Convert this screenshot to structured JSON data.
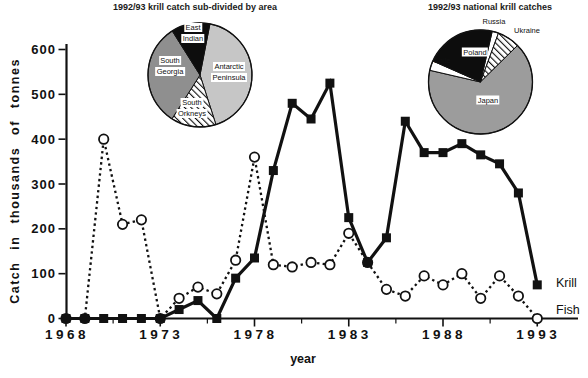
{
  "figure": {
    "background": "#ffffff",
    "ink": "#111111",
    "gray_light": "#c6c6c6",
    "gray_mid": "#9c9c9c",
    "gray_dark": "#8f8f8f",
    "black": "#0d0d0d"
  },
  "pies": [
    {
      "title": "1992/93 krill catch sub-divided by area",
      "start_angle_deg": 11,
      "slices": [
        {
          "label": "Antarctic Peninsula",
          "percent": 42,
          "fill": "#c6c6c6",
          "pattern": "solid"
        },
        {
          "label": "South Orkneys",
          "percent": 14,
          "fill": "#ffffff",
          "pattern": "hatch"
        },
        {
          "label": "South Georgia",
          "percent": 32,
          "fill": "#8f8f8f",
          "pattern": "solid"
        },
        {
          "label": "East Indian",
          "percent": 12,
          "fill": "#0d0d0d",
          "pattern": "solid"
        }
      ]
    },
    {
      "title": "1992/93 national krill catches",
      "start_angle_deg": 13,
      "slices": [
        {
          "label": "Russia",
          "percent": 2,
          "fill": "#ffffff",
          "pattern": "solid"
        },
        {
          "label": "Ukraine",
          "percent": 7,
          "fill": "#ffffff",
          "pattern": "hatch"
        },
        {
          "label": "Japan",
          "percent": 66,
          "fill": "#9c9c9c",
          "pattern": "solid"
        },
        {
          "label": "Chile",
          "percent": 3,
          "fill": "#ffffff",
          "pattern": "solid"
        },
        {
          "label": "Poland",
          "percent": 22,
          "fill": "#0d0d0d",
          "pattern": "solid"
        }
      ]
    }
  ],
  "chart_data": {
    "type": "line",
    "title": "",
    "xlabel": "year",
    "ylabel": "Catch in thousands of tonnes",
    "x": [
      1968,
      1969,
      1970,
      1971,
      1972,
      1973,
      1974,
      1975,
      1976,
      1977,
      1978,
      1979,
      1980,
      1981,
      1982,
      1983,
      1984,
      1985,
      1986,
      1987,
      1988,
      1989,
      1990,
      1991,
      1992,
      1993
    ],
    "x_tick_labels": [
      1968,
      1973,
      1978,
      1983,
      1988,
      1993
    ],
    "x_minor_ticks": [
      1970.5,
      1975.5,
      1980.5,
      1985.5,
      1990.5
    ],
    "ylim": [
      0,
      600
    ],
    "y_ticks": [
      0,
      100,
      200,
      300,
      400,
      500,
      600
    ],
    "grid": false,
    "legend_position": "line-end-right",
    "series": [
      {
        "name": "Krill",
        "line_style": "solid",
        "marker": "filled-square",
        "values": [
          0,
          0,
          0,
          0,
          0,
          0,
          20,
          40,
          0,
          90,
          135,
          330,
          480,
          445,
          525,
          225,
          125,
          180,
          440,
          370,
          370,
          390,
          365,
          345,
          280,
          75
        ]
      },
      {
        "name": "Fish",
        "line_style": "dotted",
        "marker": "open-circle",
        "values": [
          0,
          0,
          400,
          210,
          220,
          0,
          45,
          70,
          55,
          130,
          360,
          120,
          115,
          125,
          120,
          190,
          125,
          65,
          50,
          95,
          75,
          100,
          45,
          95,
          50,
          0
        ]
      }
    ]
  }
}
